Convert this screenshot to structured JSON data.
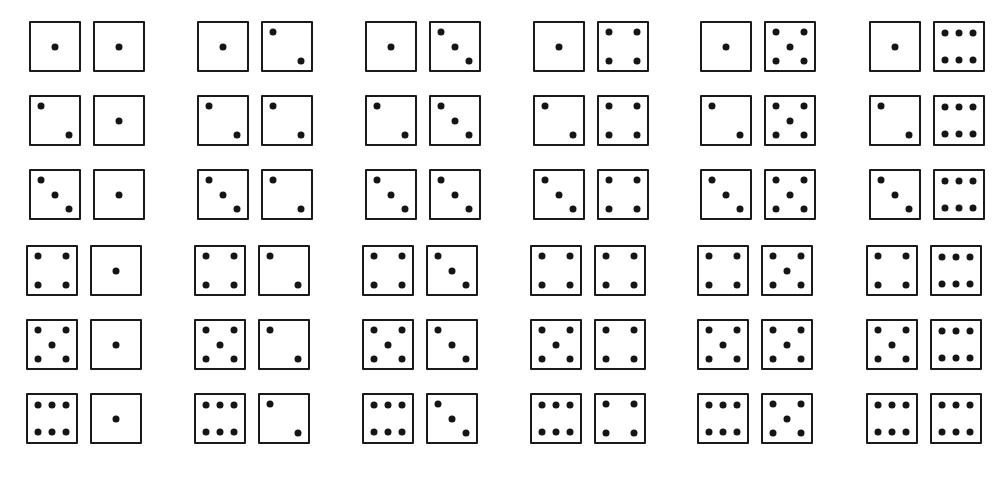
{
  "colors": {
    "background": "#ffffff",
    "outline": "#1a1a1a",
    "pip": "#151515"
  },
  "layout": {
    "columns": 6,
    "rows": 6,
    "column_x": [
      29,
      197,
      365,
      533,
      700,
      869
    ],
    "row_y": [
      21,
      95,
      169,
      245,
      319,
      393
    ]
  },
  "outcomes": [
    [
      [
        1,
        1
      ],
      [
        1,
        2
      ],
      [
        1,
        3
      ],
      [
        1,
        4
      ],
      [
        1,
        5
      ],
      [
        1,
        6
      ]
    ],
    [
      [
        2,
        1
      ],
      [
        2,
        2
      ],
      [
        2,
        3
      ],
      [
        2,
        4
      ],
      [
        2,
        5
      ],
      [
        2,
        6
      ]
    ],
    [
      [
        3,
        1
      ],
      [
        3,
        2
      ],
      [
        3,
        3
      ],
      [
        3,
        4
      ],
      [
        3,
        5
      ],
      [
        3,
        6
      ]
    ],
    [
      [
        4,
        1
      ],
      [
        4,
        2
      ],
      [
        4,
        3
      ],
      [
        4,
        4
      ],
      [
        4,
        5
      ],
      [
        4,
        6
      ]
    ],
    [
      [
        5,
        1
      ],
      [
        5,
        2
      ],
      [
        5,
        3
      ],
      [
        5,
        4
      ],
      [
        5,
        5
      ],
      [
        5,
        6
      ]
    ],
    [
      [
        6,
        1
      ],
      [
        6,
        2
      ],
      [
        6,
        3
      ],
      [
        6,
        4
      ],
      [
        6,
        5
      ],
      [
        6,
        6
      ]
    ]
  ],
  "pip_layouts": {
    "1": [
      [
        50,
        50
      ]
    ],
    "2": [
      [
        20,
        20
      ],
      [
        80,
        80
      ]
    ],
    "3": [
      [
        20,
        20
      ],
      [
        50,
        50
      ],
      [
        80,
        80
      ]
    ],
    "4": [
      [
        20,
        20
      ],
      [
        80,
        20
      ],
      [
        20,
        80
      ],
      [
        80,
        80
      ]
    ],
    "5": [
      [
        20,
        20
      ],
      [
        80,
        20
      ],
      [
        50,
        50
      ],
      [
        20,
        80
      ],
      [
        80,
        80
      ]
    ],
    "6": [
      [
        20,
        22
      ],
      [
        50,
        22
      ],
      [
        80,
        22
      ],
      [
        20,
        78
      ],
      [
        50,
        78
      ],
      [
        80,
        78
      ]
    ]
  }
}
